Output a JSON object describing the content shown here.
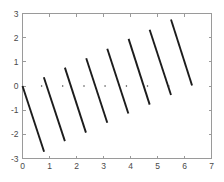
{
  "chart_data": {
    "type": "line",
    "title": "",
    "subtitle": "",
    "xlabel": "",
    "ylabel": "",
    "xlim": [
      0,
      7
    ],
    "ylim": [
      -3,
      3
    ],
    "xticks": [
      0,
      1,
      2,
      3,
      4,
      5,
      6,
      7
    ],
    "xticklabels": [
      "0",
      "1",
      "2",
      "3",
      "4",
      "5",
      "6",
      "7"
    ],
    "yticks": [
      -3,
      -2,
      -1,
      0,
      1,
      2,
      3
    ],
    "yticklabels": [
      "-3",
      "-2",
      "-1",
      "0",
      "1",
      "2",
      "3"
    ],
    "grid": false,
    "legend": null,
    "legend_position": "none",
    "box": true,
    "series_color": "#1c1c1c",
    "axis_color": "#9a9a9a",
    "background": "#ffffff",
    "segment_count": 9,
    "segments": [
      {
        "x1": 0.0,
        "y1": 0.0,
        "x2": 0.8,
        "y2": -2.72
      },
      {
        "x1": 0.79,
        "y1": 0.36,
        "x2": 1.57,
        "y2": -2.28
      },
      {
        "x1": 1.57,
        "y1": 0.76,
        "x2": 2.35,
        "y2": -1.93
      },
      {
        "x1": 2.36,
        "y1": 1.15,
        "x2": 3.14,
        "y2": -1.52
      },
      {
        "x1": 3.14,
        "y1": 1.54,
        "x2": 3.92,
        "y2": -1.14
      },
      {
        "x1": 3.93,
        "y1": 1.95,
        "x2": 4.71,
        "y2": -0.77
      },
      {
        "x1": 4.71,
        "y1": 2.33,
        "x2": 5.5,
        "y2": -0.37
      },
      {
        "x1": 5.5,
        "y1": 2.75,
        "x2": 6.28,
        "y2": 0.02
      }
    ],
    "zero_dots_x": [
      0.79,
      1.57,
      2.36,
      3.14,
      3.93,
      4.71,
      5.5
    ],
    "zero_dots_y": 0
  }
}
